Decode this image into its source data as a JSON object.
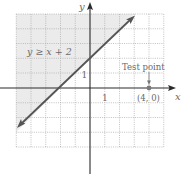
{
  "diagram": {
    "inequality_label": "y ≥ x + 2",
    "axes": {
      "x_label": "x",
      "y_label": "y",
      "x_tick_label": "1",
      "y_tick_label": "1",
      "x_range": [
        -5,
        5
      ],
      "y_range": [
        -4,
        5
      ]
    },
    "boundary_line": {
      "equation": "y = x + 2",
      "style": "solid",
      "x_intercept": [
        -2,
        0
      ],
      "y_intercept": [
        0,
        2
      ]
    },
    "shaded_region": "above the line (y ≥ x + 2)",
    "test_point": {
      "label": "Test point",
      "coords_label": "(4, 0)",
      "x": 4,
      "y": 0
    },
    "colors": {
      "shade": "#ebebeb",
      "grid": "#a8a8a8",
      "axis": "#2a2a2a",
      "line": "#555555",
      "point": "#7a7a7a",
      "text": "#6a6a6a"
    }
  }
}
